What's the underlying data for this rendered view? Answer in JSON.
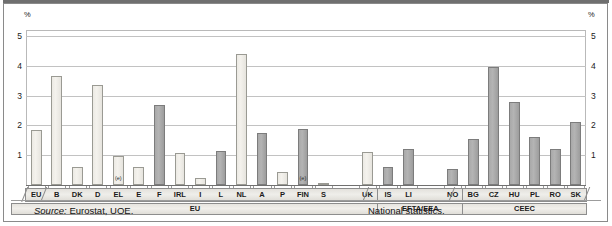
{
  "chart_data": {
    "type": "bar",
    "title": "",
    "xlabel": "",
    "ylabel": "%",
    "unit_label_left": "%",
    "unit_label_right": "%",
    "ylim": [
      0,
      5.2
    ],
    "yticks": [
      1,
      2,
      3,
      4,
      5
    ],
    "ytick_labels": [
      "1",
      "2",
      "3",
      "4",
      "5"
    ],
    "grid": true,
    "legend": null,
    "categories": [
      "EU",
      "B",
      "DK",
      "D",
      "EL",
      "E",
      "F",
      "IRL",
      "I",
      "L",
      "NL",
      "A",
      "P",
      "FIN",
      "S",
      "UK",
      "IS",
      "LI",
      "NO",
      "BG",
      "CZ",
      "HU",
      "PL",
      "RO",
      "SK"
    ],
    "values": [
      1.85,
      3.65,
      0.6,
      3.35,
      0.97,
      0.6,
      2.7,
      1.08,
      0.22,
      1.15,
      4.4,
      1.75,
      0.45,
      1.88,
      0.07,
      1.1,
      0.6,
      1.2,
      0.55,
      1.55,
      3.95,
      2.8,
      1.6,
      1.2,
      2.1
    ],
    "bar_styles": [
      "light",
      "light",
      "light",
      "light",
      "light",
      "light",
      "dark",
      "light",
      "light",
      "dark",
      "light",
      "dark",
      "light",
      "dark",
      "light",
      "light",
      "dark",
      "dark",
      "dark",
      "dark",
      "dark",
      "dark",
      "dark",
      "dark",
      "dark"
    ],
    "estimated_flags": [
      false,
      false,
      false,
      false,
      true,
      false,
      false,
      false,
      false,
      false,
      false,
      false,
      false,
      true,
      false,
      false,
      false,
      false,
      false,
      false,
      false,
      false,
      false,
      false,
      false
    ],
    "estimate_marker": "(e)",
    "groups": [
      {
        "label": "EU",
        "members": [
          "EU",
          "B",
          "DK",
          "D",
          "EL",
          "E",
          "F",
          "IRL",
          "I",
          "L",
          "NL",
          "A",
          "P",
          "FIN",
          "S",
          "UK"
        ]
      },
      {
        "label": "EFTA/EEA",
        "members": [
          "IS",
          "LI",
          "NO"
        ]
      },
      {
        "label": "CEEC",
        "members": [
          "BG",
          "CZ",
          "HU",
          "PL",
          "RO",
          "SK"
        ]
      }
    ],
    "source_prefix": "Source:",
    "source_text": "Eurostat, UOE.",
    "secondary_source": "National statistics."
  },
  "footer": {
    "source_prefix": "Source:",
    "source_value": "Eurostat, UOE.",
    "national": "National statistics."
  },
  "axis": {
    "unit_left": "%",
    "unit_right": "%"
  }
}
